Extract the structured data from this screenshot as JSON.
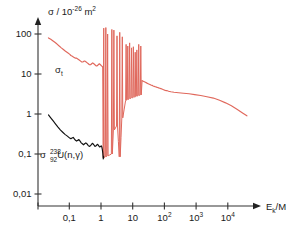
{
  "chart_data": {
    "type": "line",
    "title": "",
    "xlabel": "E_k/MeV",
    "ylabel": "σ / 10⁻²⁶ m²",
    "xscale": "log",
    "yscale": "log",
    "xlim": [
      0.02,
      40000
    ],
    "ylim": [
      0.01,
      200
    ],
    "grid": false,
    "legend_position": "inline-annotations",
    "axis_labels": {
      "y_symbol": "σ",
      "y_divider": "/ 10",
      "y_exponent": "-26",
      "y_unit": "m",
      "y_unit_exponent": "2",
      "x_symbol": "E",
      "x_subscript": "k",
      "x_unit": "/MeV"
    },
    "xticks": [
      {
        "value": 0.1,
        "label": "0,1"
      },
      {
        "value": 1,
        "label": "1"
      },
      {
        "value": 10,
        "label": "10"
      },
      {
        "value": 100,
        "label": "10",
        "exponent": "2"
      },
      {
        "value": 1000,
        "label": "10",
        "exponent": "3"
      },
      {
        "value": 10000,
        "label": "10",
        "exponent": "4"
      }
    ],
    "yticks": [
      {
        "value": 100,
        "label": "100"
      },
      {
        "value": 10,
        "label": "10"
      },
      {
        "value": 1,
        "label": "1"
      },
      {
        "value": 0.1,
        "label": "0,1"
      },
      {
        "value": 0.01,
        "label": "0,01"
      }
    ],
    "series": [
      {
        "name": "sigma-t",
        "annotation": "σ",
        "annotation_sub": "t",
        "color": "#e0685c",
        "description": "total cross section with resonance spikes",
        "x": [
          0.022,
          0.026,
          0.03,
          0.035,
          0.041,
          0.048,
          0.056,
          0.065,
          0.076,
          0.089,
          0.104,
          0.112,
          0.121,
          0.131,
          0.142,
          0.153,
          0.166,
          0.18,
          0.195,
          0.211,
          0.228,
          0.247,
          0.268,
          0.29,
          0.314,
          0.34,
          0.368,
          0.399,
          0.432,
          0.468,
          0.507,
          0.549,
          0.595,
          0.644,
          0.698,
          0.756,
          0.819,
          0.887,
          0.96,
          1.04,
          1.13,
          1.22,
          1.32,
          1.43,
          1.55,
          1.68,
          1.82,
          1.97,
          2.13,
          2.31,
          2.5,
          2.71,
          2.93,
          3.17,
          3.44,
          3.72,
          4.03,
          4.37,
          4.73,
          5.12,
          5.55,
          6.01,
          6.51,
          7.05,
          7.63,
          8.27,
          8.95,
          9.7,
          10.5,
          11.4,
          12.3,
          13.3,
          14.4,
          15.6,
          16.9,
          18.3,
          19.8,
          21.5,
          23.3,
          25.2,
          27.3,
          29.6,
          32.0,
          34.7,
          37.6,
          40.7,
          44.1,
          47.7,
          51.7,
          56.0,
          60.7,
          65.7,
          71.2,
          77.1,
          83.5,
          90.4,
          98.0,
          106,
          115,
          125,
          135,
          160,
          200,
          280,
          400,
          600,
          900,
          1400,
          2200,
          3500,
          5500,
          8500,
          13000,
          20000,
          30000,
          40000
        ],
        "y": [
          80,
          74,
          68,
          62,
          56,
          50,
          45,
          41,
          37,
          34,
          31,
          29,
          28,
          27,
          26,
          25,
          25,
          24,
          23,
          22,
          21,
          20,
          20,
          21,
          21,
          20,
          19,
          18,
          17,
          17,
          18,
          19,
          18,
          17,
          16,
          16,
          17,
          18,
          17,
          16,
          15,
          14,
          13,
          13,
          14,
          15,
          14,
          13,
          12,
          12,
          12,
          11,
          11,
          10,
          10,
          10,
          10,
          10,
          10,
          10,
          10,
          10,
          9.5,
          9.5,
          9.2,
          9.0,
          8.8,
          8.6,
          8.4,
          8.2,
          8.0,
          7.8,
          7.6,
          7.4,
          7.2,
          7.0,
          6.8,
          6.6,
          6.4,
          6.2,
          6.0,
          5.8,
          5.6,
          5.5,
          5.3,
          5.2,
          5.0,
          4.9,
          4.8,
          4.7,
          4.6,
          4.5,
          4.4,
          4.3,
          4.2,
          4.1,
          4.0,
          3.9,
          3.85,
          3.8,
          3.7,
          3.6,
          3.5,
          3.4,
          3.3,
          3.2,
          3.05,
          2.9,
          2.7,
          2.5,
          2.2,
          1.9,
          1.6,
          1.3,
          1.05,
          0.9
        ],
        "resonances": [
          {
            "x": 1.22,
            "peak": 140,
            "valley": 0.08
          },
          {
            "x": 1.42,
            "peak": 145,
            "valley": 0.085
          },
          {
            "x": 1.62,
            "peak": 100,
            "valley": 0.09
          },
          {
            "x": 2.2,
            "peak": 130,
            "valley": 0.1
          },
          {
            "x": 2.55,
            "peak": 125,
            "valley": 0.4
          },
          {
            "x": 3.2,
            "peak": 90,
            "valley": 0.5
          },
          {
            "x": 3.9,
            "peak": 110,
            "valley": 0.085
          },
          {
            "x": 4.7,
            "peak": 85,
            "valley": 0.8
          },
          {
            "x": 6.2,
            "peak": 55,
            "valley": 2.2
          },
          {
            "x": 7.0,
            "peak": 50,
            "valley": 2.3
          },
          {
            "x": 8.0,
            "peak": 60,
            "valley": 2.4
          },
          {
            "x": 9.2,
            "peak": 45,
            "valley": 2.5
          },
          {
            "x": 10.5,
            "peak": 48,
            "valley": 2.6
          },
          {
            "x": 12.0,
            "peak": 35,
            "valley": 2.7
          },
          {
            "x": 13.5,
            "peak": 40,
            "valley": 2.8
          },
          {
            "x": 15.5,
            "peak": 55,
            "valley": 2.9
          },
          {
            "x": 18.0,
            "peak": 50,
            "valley": 3.0
          }
        ]
      },
      {
        "name": "sigma-capture",
        "annotation": "σ",
        "annotation_iso_sup": "238",
        "annotation_iso_sub": "92",
        "annotation_rest": "U(n,γ)",
        "color": "#111111",
        "description": "radiative capture cross section of U-238",
        "x": [
          0.022,
          0.026,
          0.031,
          0.037,
          0.044,
          0.052,
          0.062,
          0.073,
          0.087,
          0.103,
          0.112,
          0.122,
          0.133,
          0.144,
          0.157,
          0.17,
          0.185,
          0.201,
          0.219,
          0.238,
          0.258,
          0.281,
          0.305,
          0.332,
          0.361,
          0.392,
          0.426,
          0.463,
          0.503,
          0.547,
          0.594,
          0.646,
          0.702,
          0.763,
          0.829,
          0.901,
          0.979,
          1.02,
          1.06,
          1.1,
          1.14,
          1.18,
          1.21
        ],
        "y": [
          0.95,
          0.8,
          0.67,
          0.56,
          0.47,
          0.4,
          0.35,
          0.31,
          0.28,
          0.25,
          0.24,
          0.25,
          0.26,
          0.24,
          0.22,
          0.21,
          0.22,
          0.23,
          0.21,
          0.19,
          0.18,
          0.17,
          0.18,
          0.19,
          0.18,
          0.165,
          0.155,
          0.16,
          0.175,
          0.185,
          0.17,
          0.155,
          0.16,
          0.175,
          0.165,
          0.15,
          0.155,
          0.16,
          0.15,
          0.13,
          0.105,
          0.075,
          0.088
        ]
      }
    ]
  }
}
